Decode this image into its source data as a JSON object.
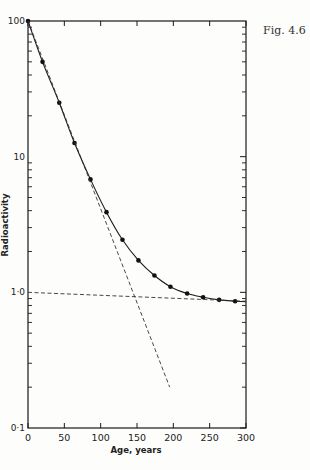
{
  "figure_label": "Fig. 4.6",
  "chart_data": {
    "type": "line",
    "title": "",
    "xlabel": "Age, years",
    "ylabel": "Radioactivity",
    "yscale": "log",
    "xlim": [
      0,
      300
    ],
    "ylim": [
      0.1,
      100
    ],
    "x_ticks": [
      0,
      50,
      100,
      150,
      200,
      250,
      300
    ],
    "x_tick_labels": [
      "0",
      "50",
      "100",
      "150",
      "200",
      "250",
      "300"
    ],
    "y_ticks": [
      0.1,
      1,
      10,
      100
    ],
    "y_tick_labels": [
      "0·1",
      "1·0",
      "10",
      "100"
    ],
    "grid": false,
    "legend": null,
    "series": [
      {
        "name": "Measured radioactivity",
        "style": "solid line with points",
        "x": [
          0,
          20,
          43,
          64,
          86,
          108,
          130,
          152,
          174,
          196,
          219,
          241,
          263,
          285
        ],
        "y": [
          100,
          50,
          25,
          12.6,
          6.8,
          3.9,
          2.44,
          1.72,
          1.33,
          1.1,
          0.98,
          0.92,
          0.88,
          0.86
        ]
      },
      {
        "name": "Short-lived component (extrapolated)",
        "style": "dashed",
        "x": [
          0,
          195
        ],
        "y": [
          100,
          0.2
        ]
      },
      {
        "name": "Long-lived component (extrapolated)",
        "style": "dashed",
        "x": [
          0,
          300
        ],
        "y": [
          1.0,
          0.86
        ]
      }
    ]
  }
}
